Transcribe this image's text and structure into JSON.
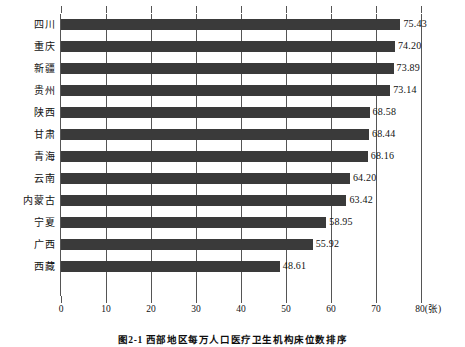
{
  "chart_data": {
    "type": "bar",
    "orientation": "horizontal",
    "title": "图2-1 西部地区每万人口医疗卫生机构床位数排序",
    "xlabel": "80(张)",
    "ylabel": "",
    "unit": "张",
    "xlim": [
      0,
      80
    ],
    "xticks": [
      0,
      10,
      20,
      30,
      40,
      50,
      60,
      70,
      80
    ],
    "xtick_labels": [
      "0",
      "10",
      "20",
      "30",
      "40",
      "50",
      "60",
      "70",
      "80(张)"
    ],
    "grid": true,
    "legend": false,
    "bar_color": "#3a3a3a",
    "categories": [
      "四川",
      "重庆",
      "新疆",
      "贵州",
      "陕西",
      "甘肃",
      "青海",
      "云南",
      "内蒙古",
      "宁夏",
      "广西",
      "西藏"
    ],
    "values": [
      75.43,
      74.2,
      73.89,
      73.14,
      68.58,
      68.44,
      68.16,
      64.2,
      63.42,
      58.95,
      55.92,
      48.61
    ],
    "value_labels": [
      "75.43",
      "74.20",
      "73.89",
      "73.14",
      "68.58",
      "68.44",
      "68.16",
      "64.20",
      "63.42",
      "58.95",
      "55.92",
      "48.61"
    ]
  },
  "caption": {
    "text": "图2-1 西部地区每万人口医疗卫生机构床位数排序"
  }
}
